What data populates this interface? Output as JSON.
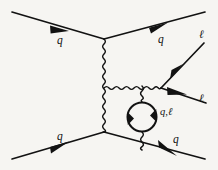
{
  "figure": {
    "kind": "feynman-diagram",
    "background_color": "#f6f5f2",
    "ink_color": "#121212",
    "width": 218,
    "height": 170
  },
  "labels": {
    "incoming_quark_top": "q",
    "outgoing_quark_top": "q",
    "incoming_quark_bottom": "q",
    "outgoing_quark_bottom": "q",
    "lepton_upper": "ℓ",
    "lepton_lower": "ℓ",
    "loop_particles": "q,ℓ"
  },
  "elements": {
    "propagator_main": "wavy-boson-propagator-vertical",
    "propagator_branch": "wavy-boson-propagator-horizontal",
    "propagator_loop_top": "wavy-boson-to-loop",
    "propagator_loop_bottom": "wavy-boson-from-loop",
    "loop": "fermion-loop-circle",
    "vertex_top": "quark-boson-vertex-top",
    "vertex_bottom": "quark-boson-vertex-bottom",
    "vertex_lepton": "lepton-pair-vertex"
  }
}
